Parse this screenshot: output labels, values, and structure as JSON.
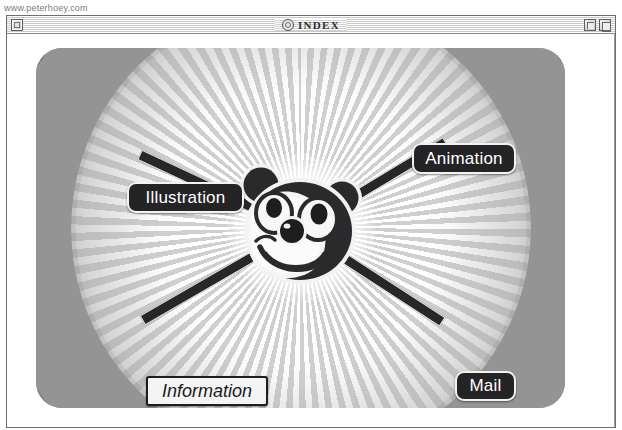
{
  "page": {
    "url_text": "www.peterhoey.com"
  },
  "window": {
    "title": "INDEX",
    "title_icon": "at-sign-circle-icon",
    "close_box_label": "close-box",
    "zoom_button_label": "zoom-box",
    "collapse_button_label": "collapse-box"
  },
  "artwork": {
    "center_figure": "bear-face-mascot",
    "background": "radial-sunburst",
    "colors": {
      "label_dark_bg": "#242427",
      "label_dark_border": "#f2f2f2",
      "label_light_bg": "#f4f4f4",
      "label_light_border": "#1d1d1f",
      "spoke": "#27272a",
      "panel_base": "#8f8f8f"
    }
  },
  "nav": {
    "items": [
      {
        "label": "Animation",
        "style": "dark"
      },
      {
        "label": "Illustration",
        "style": "dark"
      },
      {
        "label": "Information",
        "style": "light"
      },
      {
        "label": "Mail",
        "style": "dark"
      }
    ]
  }
}
